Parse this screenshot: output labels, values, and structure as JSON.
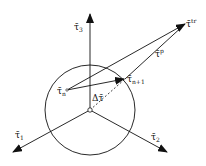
{
  "diagram": {
    "type": "return-mapping yield surface diagram",
    "colors": {
      "line": "#111111",
      "background": "#ffffff"
    },
    "circle": {
      "label": "yield surface"
    },
    "axes": [
      {
        "id": "tau1",
        "symbol": "τ̄",
        "subscript": "1"
      },
      {
        "id": "tau2",
        "symbol": "τ̄",
        "subscript": "2"
      },
      {
        "id": "tau3",
        "symbol": "τ̄",
        "subscript": "3"
      }
    ],
    "points": {
      "tau_n": {
        "symbol": "τ̄",
        "subscript": "n"
      },
      "tau_n1": {
        "symbol": "τ̄",
        "subscript": "n+1"
      },
      "tau_tr": {
        "symbol": "τ̄",
        "superscript": "tr"
      }
    },
    "vectors": {
      "delta_tau": {
        "label": "Δτ̄"
      },
      "tau_p": {
        "symbol": "τ̄",
        "superscript": "p"
      }
    }
  }
}
